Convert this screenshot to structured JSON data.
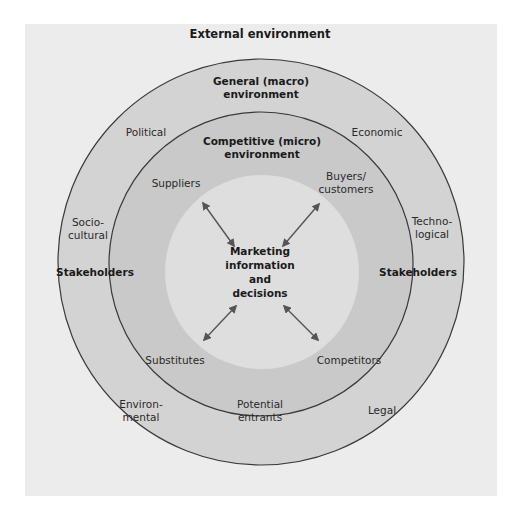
{
  "diagram": {
    "colors": {
      "panel_bg": "#ececec",
      "macro_ring": "#d3d3d3",
      "micro_ring": "#c9c9c9",
      "core": "#dedede",
      "stroke": "#3a3a3a",
      "arrow": "#555555"
    },
    "title": "External environment",
    "macro": {
      "title": "General (macro)\nenvironment",
      "forces": {
        "political": "Political",
        "economic": "Economic",
        "socio_cultural": "Socio-\ncultural",
        "technological": "Techno-\nlogical",
        "environmental": "Environ-\nmental",
        "legal": "Legal"
      }
    },
    "micro": {
      "title": "Competitive (micro)\nenvironment",
      "forces": {
        "suppliers": "Suppliers",
        "buyers": "Buyers/\ncustomers",
        "substitutes": "Substitutes",
        "competitors": "Competitors",
        "potential_entrants": "Potential\nentrants"
      }
    },
    "stakeholders_left": "Stakeholders",
    "stakeholders_right": "Stakeholders",
    "core": "Marketing\ninformation\nand\ndecisions"
  }
}
